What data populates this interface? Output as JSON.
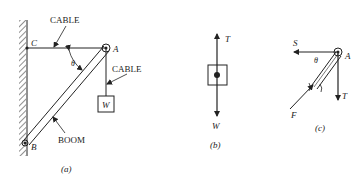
{
  "figure_a": {
    "caption": "(a)",
    "labels": {
      "C": "C",
      "A": "A",
      "B": "B",
      "theta": "θ",
      "cable_top": "CABLE",
      "cable_right": "CABLE",
      "boom": "BOOM",
      "weight": "W"
    }
  },
  "figure_b": {
    "caption": "(b)",
    "labels": {
      "T": "T",
      "W": "W"
    }
  },
  "figure_c": {
    "caption": "(c)",
    "labels": {
      "S": "S",
      "A": "A",
      "theta": "θ",
      "T": "T",
      "F": "F"
    }
  },
  "colors": {
    "ink": "#222222",
    "background": "#ffffff"
  }
}
